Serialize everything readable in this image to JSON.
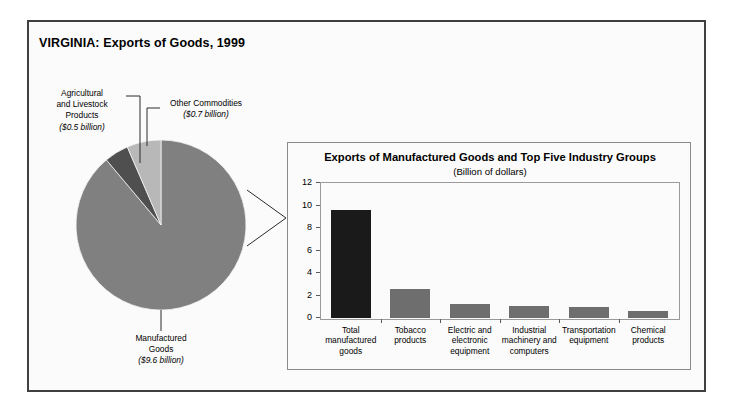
{
  "figure": {
    "title": "VIRGINIA: Exports of Goods, 1999",
    "frame_color": "#404040",
    "background": "#fbfbfb"
  },
  "chart_data": [
    {
      "type": "pie",
      "title": "VIRGINIA: Exports of Goods, 1999",
      "unit": "Billion of dollars",
      "slices": [
        {
          "label": "Manufactured Goods",
          "label_line1": "Manufactured",
          "label_line2": "Goods",
          "value": 9.6,
          "amount_text": "($9.6 billion)",
          "color": "#808080",
          "percent": 88.9
        },
        {
          "label": "Agricultural and Livestock Products",
          "label_line1": "Agricultural",
          "label_line2": "and Livestock",
          "label_line3": "Products",
          "value": 0.5,
          "amount_text": "($0.5 billion)",
          "color": "#4f4f4f",
          "percent": 4.6
        },
        {
          "label": "Other Commodities",
          "label_line1": "Other Commodities",
          "value": 0.7,
          "amount_text": "($0.7 billion)",
          "color": "#b8b8b8",
          "percent": 6.5
        }
      ],
      "total": 10.8,
      "legend": "labels-with-leader-lines"
    },
    {
      "type": "bar",
      "title": "Exports of Manufactured Goods and Top Five Industry Groups",
      "subtitle": "(Billion of dollars)",
      "xlabel": "",
      "ylabel": "",
      "ylim": [
        0,
        12
      ],
      "yticks": [
        0,
        2,
        4,
        6,
        8,
        10,
        12
      ],
      "ytick_labels": [
        "0",
        "2",
        "4",
        "6",
        "8",
        "10",
        "12"
      ],
      "grid": false,
      "categories": [
        "Total manufactured goods",
        "Tobacco products",
        "Electric and electronic equipment",
        "Industrial machinery and computers",
        "Transportation equipment",
        "Chemical products"
      ],
      "category_lines": [
        [
          "Total",
          "manufactured",
          "goods"
        ],
        [
          "Tobacco",
          "products"
        ],
        [
          "Electric and",
          "electronic",
          "equipment"
        ],
        [
          "Industrial",
          "machinery and",
          "computers"
        ],
        [
          "Transportation",
          "equipment"
        ],
        [
          "Chemical",
          "products"
        ]
      ],
      "values": [
        9.6,
        2.6,
        1.25,
        1.1,
        1.0,
        0.6
      ],
      "bar_colors": [
        "#1a1a1a",
        "#6e6e6e",
        "#6e6e6e",
        "#6e6e6e",
        "#6e6e6e",
        "#6e6e6e"
      ]
    }
  ]
}
